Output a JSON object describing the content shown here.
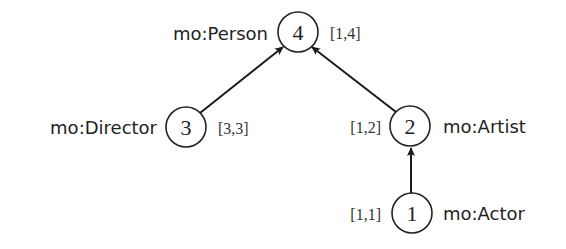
{
  "diagram": {
    "type": "class-hierarchy-tree",
    "nodes": [
      {
        "id": "4",
        "number": "4",
        "class_label": "mo:Person",
        "interval": "[1,4]"
      },
      {
        "id": "3",
        "number": "3",
        "class_label": "mo:Director",
        "interval": "[3,3]"
      },
      {
        "id": "2",
        "number": "2",
        "class_label": "mo:Artist",
        "interval": "[1,2]"
      },
      {
        "id": "1",
        "number": "1",
        "class_label": "mo:Actor",
        "interval": "[1,1]"
      }
    ],
    "edges": [
      {
        "from": "3",
        "to": "4"
      },
      {
        "from": "2",
        "to": "4"
      },
      {
        "from": "1",
        "to": "2"
      }
    ],
    "colors": {
      "line": "#1a1a1a",
      "background": "#ffffff"
    }
  }
}
